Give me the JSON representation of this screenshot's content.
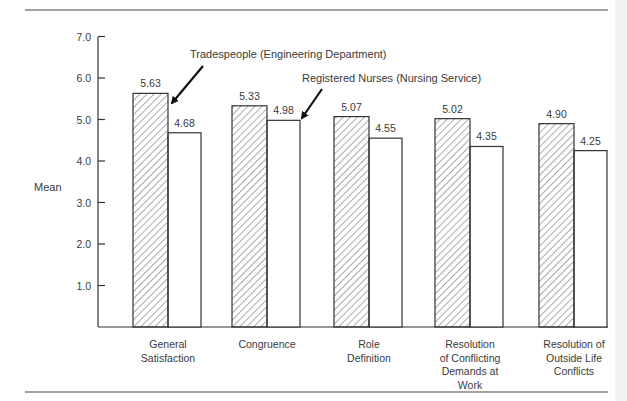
{
  "chart_data": {
    "type": "bar",
    "title": "",
    "xlabel": "",
    "ylabel": "Mean",
    "ylim": [
      0,
      7.0
    ],
    "yticks": [
      "1.0",
      "2.0",
      "3.0",
      "4.0",
      "5.0",
      "6.0",
      "7.0"
    ],
    "grid": false,
    "categories": [
      [
        "General",
        "Satisfaction"
      ],
      [
        "Congruence"
      ],
      [
        "Role",
        "Definition"
      ],
      [
        "Resolution",
        "of Conflicting",
        "Demands at",
        "Work"
      ],
      [
        "Resolution of",
        "Outside Life",
        "Conflicts"
      ]
    ],
    "series": [
      {
        "name": "Tradespeople (Engineering Department)",
        "pattern": "hatched",
        "values": [
          5.63,
          5.33,
          5.07,
          5.02,
          4.9
        ],
        "labels": [
          "5.63",
          "5.33",
          "5.07",
          "5.02",
          "4.90"
        ]
      },
      {
        "name": "Registered Nurses (Nursing Service)",
        "pattern": "open",
        "values": [
          4.68,
          4.98,
          4.55,
          4.35,
          4.25
        ],
        "labels": [
          "4.68",
          "4.98",
          "4.55",
          "4.35",
          "4.25"
        ]
      }
    ],
    "annotations": [
      {
        "text": "Tradespeople (Engineering Department)",
        "points_to": "General Satisfaction hatched bar"
      },
      {
        "text": "Registered Nurses (Nursing Service)",
        "points_to": "Congruence open bar"
      }
    ],
    "legend_position": "annotations with arrows"
  }
}
